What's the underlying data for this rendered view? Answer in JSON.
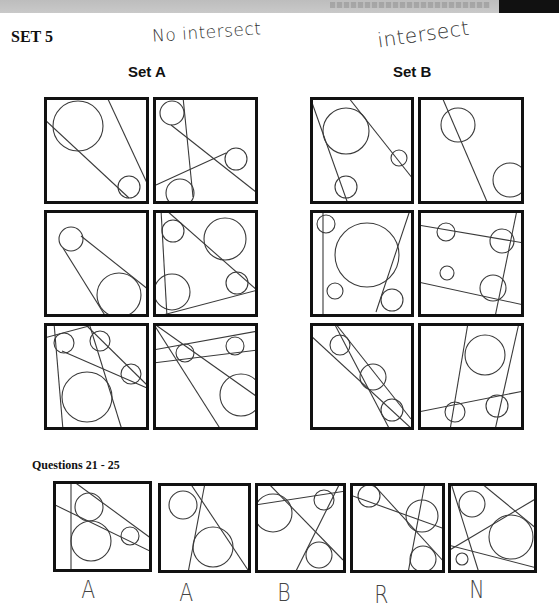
{
  "header": {
    "bar_color": "#c4c4c4",
    "block_color": "#111111"
  },
  "page": {
    "title": "SET 5",
    "annotations": {
      "set_a_note": "No intersect",
      "set_b_note": "intersect"
    }
  },
  "set_a": {
    "title": "Set A",
    "figures": [
      {
        "x": 44,
        "y": 97,
        "w": 105,
        "h": 107,
        "circles": [
          [
            34,
            29,
            25
          ],
          [
            85,
            90,
            11
          ]
        ],
        "lines": [
          [
            0,
            22,
            85,
            101
          ],
          [
            63,
            0,
            103,
            86
          ]
        ]
      },
      {
        "x": 153,
        "y": 97,
        "w": 105,
        "h": 107,
        "circles": [
          [
            19,
            16,
            12
          ],
          [
            83,
            62,
            11
          ],
          [
            27,
            96,
            14
          ]
        ],
        "lines": [
          [
            30,
            0,
            40,
            100
          ],
          [
            18,
            28,
            103,
            95
          ],
          [
            3,
            88,
            73,
            56
          ]
        ]
      },
      {
        "x": 44,
        "y": 210,
        "w": 105,
        "h": 107,
        "circles": [
          [
            27,
            29,
            12
          ],
          [
            75,
            85,
            22
          ]
        ],
        "lines": [
          [
            19,
            38,
            62,
            107
          ],
          [
            37,
            26,
            105,
            80
          ]
        ]
      },
      {
        "x": 153,
        "y": 210,
        "w": 105,
        "h": 107,
        "circles": [
          [
            20,
            21,
            11
          ],
          [
            72,
            29,
            21
          ],
          [
            19,
            82,
            18
          ],
          [
            84,
            73,
            11
          ]
        ],
        "lines": [
          [
            8,
            0,
            14,
            107
          ],
          [
            13,
            0,
            105,
            81
          ],
          [
            10,
            105,
            105,
            80
          ]
        ]
      },
      {
        "x": 44,
        "y": 323,
        "w": 105,
        "h": 107,
        "circles": [
          [
            20,
            20,
            10
          ],
          [
            56,
            18,
            10
          ],
          [
            87,
            51,
            10
          ],
          [
            43,
            74,
            25
          ]
        ],
        "lines": [
          [
            0,
            15,
            45,
            3
          ],
          [
            10,
            0,
            19,
            107
          ],
          [
            45,
            0,
            78,
            107
          ],
          [
            18,
            28,
            103,
            65
          ],
          [
            40,
            0,
            103,
            62
          ]
        ]
      },
      {
        "x": 153,
        "y": 323,
        "w": 105,
        "h": 107,
        "circles": [
          [
            32,
            30,
            9
          ],
          [
            82,
            23,
            9
          ],
          [
            88,
            72,
            21
          ]
        ],
        "lines": [
          [
            0,
            27,
            105,
            8
          ],
          [
            0,
            40,
            105,
            27
          ],
          [
            0,
            0,
            68,
            107
          ],
          [
            0,
            0,
            103,
            73
          ]
        ]
      }
    ]
  },
  "set_b": {
    "title": "Set B",
    "figures": [
      {
        "x": 310,
        "y": 97,
        "w": 104,
        "h": 107,
        "circles": [
          [
            36,
            34,
            23
          ],
          [
            89,
            61,
            8
          ],
          [
            36,
            90,
            11
          ]
        ],
        "lines": [
          [
            0,
            0,
            38,
            107
          ],
          [
            38,
            0,
            103,
            82
          ]
        ]
      },
      {
        "x": 418,
        "y": 97,
        "w": 106,
        "h": 107,
        "circles": [
          [
            40,
            28,
            17
          ],
          [
            92,
            83,
            17
          ]
        ],
        "lines": [
          [
            24,
            0,
            70,
            107
          ]
        ]
      },
      {
        "x": 310,
        "y": 210,
        "w": 104,
        "h": 107,
        "circles": [
          [
            16,
            14,
            9
          ],
          [
            57,
            45,
            32
          ],
          [
            25,
            81,
            8
          ],
          [
            82,
            90,
            11
          ]
        ],
        "lines": [
          [
            13,
            0,
            13,
            107
          ],
          [
            100,
            0,
            66,
            102
          ]
        ]
      },
      {
        "x": 418,
        "y": 210,
        "w": 106,
        "h": 107,
        "circles": [
          [
            28,
            22,
            9
          ],
          [
            84,
            31,
            12
          ],
          [
            29,
            63,
            7
          ],
          [
            75,
            78,
            13
          ]
        ],
        "lines": [
          [
            0,
            15,
            106,
            33
          ],
          [
            0,
            72,
            106,
            95
          ],
          [
            99,
            0,
            77,
            107
          ]
        ]
      },
      {
        "x": 310,
        "y": 323,
        "w": 104,
        "h": 107,
        "circles": [
          [
            30,
            22,
            10
          ],
          [
            63,
            54,
            13
          ],
          [
            82,
            87,
            11
          ]
        ],
        "lines": [
          [
            0,
            12,
            103,
            107
          ],
          [
            24,
            0,
            80,
            107
          ],
          [
            25,
            0,
            101,
            96
          ]
        ]
      },
      {
        "x": 418,
        "y": 323,
        "w": 106,
        "h": 107,
        "circles": [
          [
            67,
            32,
            20
          ],
          [
            37,
            89,
            10
          ],
          [
            79,
            83,
            11
          ]
        ],
        "lines": [
          [
            50,
            0,
            32,
            107
          ],
          [
            101,
            0,
            77,
            107
          ],
          [
            0,
            89,
            106,
            68
          ]
        ]
      }
    ]
  },
  "questions": {
    "title": "Questions 21 - 25",
    "items": [
      {
        "number": 21,
        "answer": "A",
        "answer_x": 80,
        "answer_y": 580,
        "x": 53,
        "y": 481,
        "w": 99,
        "h": 91,
        "circles": [
          [
            36,
            26,
            14
          ],
          [
            38,
            60,
            20
          ],
          [
            77,
            55,
            9
          ]
        ],
        "lines": [
          [
            18,
            0,
            18,
            91
          ],
          [
            20,
            0,
            99,
            58
          ],
          [
            0,
            23,
            99,
            71
          ]
        ]
      },
      {
        "number": 22,
        "answer": "A",
        "answer_x": 178,
        "answer_y": 583,
        "x": 158,
        "y": 483,
        "w": 93,
        "h": 90,
        "circles": [
          [
            25,
            22,
            14
          ],
          [
            55,
            64,
            20
          ]
        ],
        "lines": [
          [
            32,
            0,
            92,
            90
          ],
          [
            47,
            0,
            30,
            90
          ]
        ]
      },
      {
        "number": 23,
        "answer": "B",
        "answer_x": 276,
        "answer_y": 583,
        "x": 255,
        "y": 483,
        "w": 91,
        "h": 90,
        "circles": [
          [
            18,
            30,
            19
          ],
          [
            69,
            17,
            10
          ],
          [
            64,
            72,
            13
          ]
        ],
        "lines": [
          [
            0,
            22,
            91,
            8
          ],
          [
            13,
            0,
            88,
            77
          ],
          [
            85,
            0,
            40,
            90
          ]
        ]
      },
      {
        "number": 24,
        "answer": "R",
        "answer_x": 373,
        "answer_y": 585,
        "x": 350,
        "y": 483,
        "w": 95,
        "h": 90,
        "circles": [
          [
            19,
            13,
            11
          ],
          [
            72,
            33,
            16
          ],
          [
            73,
            76,
            13
          ]
        ],
        "lines": [
          [
            0,
            12,
            95,
            46
          ],
          [
            22,
            0,
            95,
            80
          ],
          [
            75,
            0,
            58,
            90
          ]
        ]
      },
      {
        "number": 25,
        "answer": "N",
        "answer_x": 468,
        "answer_y": 580,
        "x": 448,
        "y": 483,
        "w": 89,
        "h": 90,
        "circles": [
          [
            24,
            21,
            13
          ],
          [
            63,
            54,
            22
          ],
          [
            14,
            76,
            6
          ]
        ],
        "lines": [
          [
            3,
            0,
            31,
            90
          ],
          [
            33,
            0,
            89,
            46
          ],
          [
            0,
            68,
            89,
            15
          ],
          [
            0,
            62,
            89,
            85
          ]
        ]
      }
    ]
  }
}
